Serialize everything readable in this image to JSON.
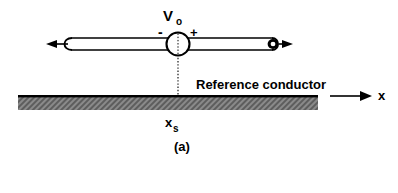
{
  "figure": {
    "caption": "(a)",
    "source": {
      "symbol": "V",
      "subscript": "o",
      "polarity_negative": "-",
      "polarity_positive": "+"
    },
    "conductor": {
      "label": "Reference conductor"
    },
    "position_marker": {
      "symbol": "x",
      "subscript": "s"
    },
    "axis": {
      "label": "x"
    },
    "colors": {
      "ink": "#000000",
      "background": "#ffffff",
      "hatch": "#6e6e6e",
      "hatch_light": "#b8b8b8"
    }
  }
}
